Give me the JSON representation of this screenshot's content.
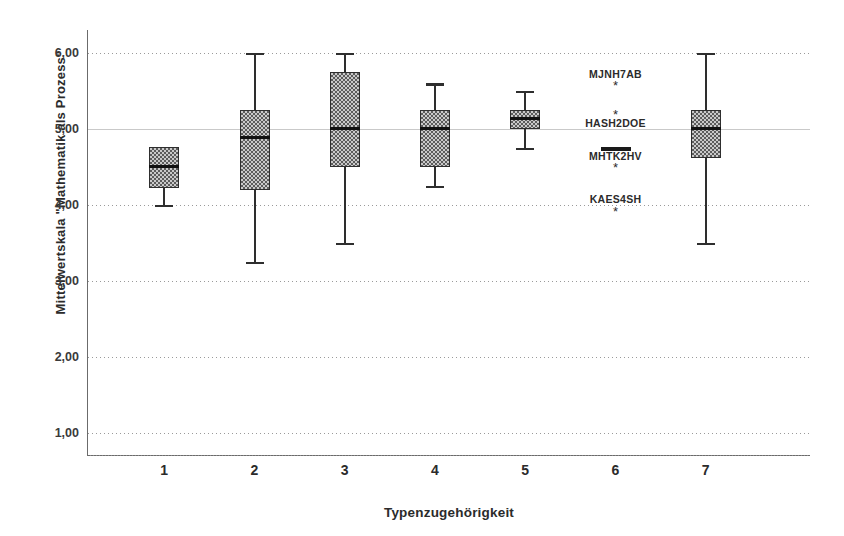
{
  "chart_data": {
    "type": "box",
    "title": "",
    "xlabel": "Typenzugehörigkeit",
    "ylabel": "Mittelwertskala \"Mathematik als Prozess\"",
    "categories": [
      "1",
      "2",
      "3",
      "4",
      "5",
      "6",
      "7"
    ],
    "ylim": [
      0.7,
      6.3
    ],
    "yticks": [
      1,
      2,
      3,
      4,
      5,
      6
    ],
    "ytick_labels": [
      "1,00",
      "2,00",
      "3,00",
      "4,00",
      "5,00",
      "6,00"
    ],
    "grid": "horizontal dotted gridlines",
    "legend": "none",
    "boxes": [
      {
        "category": "1",
        "whisker_low": 4.0,
        "q1": 4.22,
        "median": 4.5,
        "q3": 4.76,
        "whisker_high": 4.76,
        "has_upper_whisker": false
      },
      {
        "category": "2",
        "whisker_low": 3.25,
        "q1": 4.2,
        "median": 4.88,
        "q3": 5.25,
        "whisker_high": 6.0,
        "has_upper_whisker": true
      },
      {
        "category": "3",
        "whisker_low": 3.5,
        "q1": 4.5,
        "median": 5.0,
        "q3": 5.75,
        "whisker_high": 6.0,
        "has_upper_whisker": true
      },
      {
        "category": "4",
        "whisker_low": 4.25,
        "q1": 4.5,
        "median": 5.0,
        "q3": 5.25,
        "whisker_high": 5.6,
        "has_upper_whisker": true
      },
      {
        "category": "5",
        "whisker_low": 4.75,
        "q1": 5.0,
        "median": 5.13,
        "q3": 5.25,
        "whisker_high": 5.5,
        "has_upper_whisker": true
      },
      {
        "category": "6",
        "median": 4.73,
        "degenerate": true,
        "note": "single median bar only, no box or whiskers"
      },
      {
        "category": "7",
        "whisker_low": 3.5,
        "q1": 4.62,
        "median": 5.0,
        "q3": 5.25,
        "whisker_high": 6.0,
        "has_upper_whisker": true
      }
    ],
    "outliers": [
      {
        "category": "6",
        "label": "MJNH7AB",
        "value": 5.58,
        "label_value": 5.72,
        "marker": "*"
      },
      {
        "category": "6",
        "label": "HASH2DOE",
        "value": 5.2,
        "label_value": 5.07,
        "marker": "*"
      },
      {
        "category": "6",
        "label": "MHTK2HV",
        "value": 4.5,
        "label_value": 4.64,
        "marker": "*"
      },
      {
        "category": "6",
        "label": "KAES4SH",
        "value": 3.92,
        "label_value": 4.07,
        "marker": "*"
      }
    ]
  }
}
